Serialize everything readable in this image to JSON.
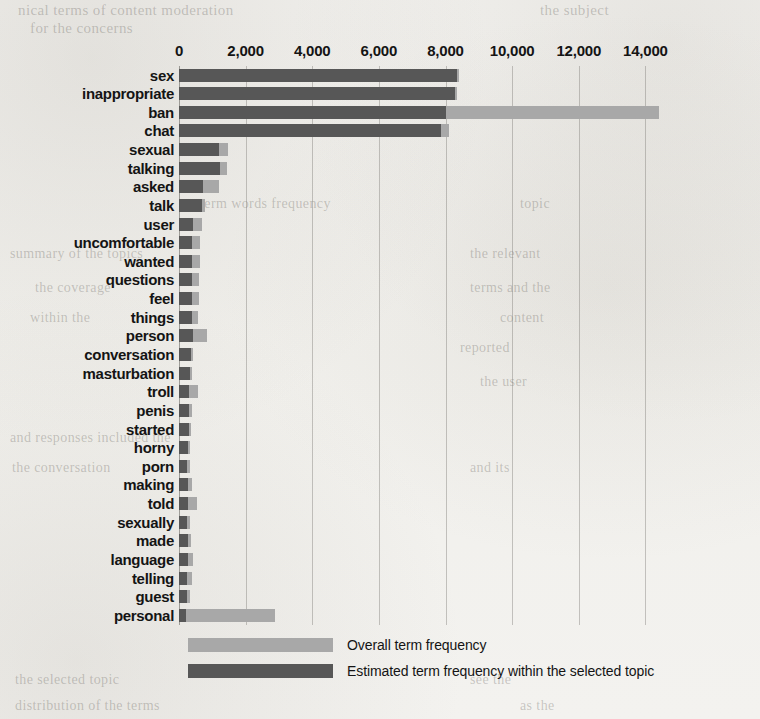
{
  "chart_data": {
    "type": "bar",
    "orientation": "horizontal",
    "title": "",
    "subtitle": "",
    "xlabel": "",
    "ylabel": "",
    "grid": true,
    "xlim": [
      0,
      16000
    ],
    "xticks": [
      0,
      2000,
      4000,
      6000,
      8000,
      10000,
      12000,
      14000
    ],
    "xtick_labels": [
      "0",
      "2,000",
      "4,000",
      "6,000",
      "8,000",
      "10,000",
      "12,000",
      "14,000"
    ],
    "legend_position": "bottom",
    "categories": [
      "sex",
      "inappropriate",
      "ban",
      "chat",
      "sexual",
      "talking",
      "asked",
      "talk",
      "user",
      "uncomfortable",
      "wanted",
      "questions",
      "feel",
      "things",
      "person",
      "conversation",
      "masturbation",
      "troll",
      "penis",
      "started",
      "horny",
      "porn",
      "making",
      "told",
      "sexually",
      "made",
      "language",
      "telling",
      "guest",
      "personal"
    ],
    "series": [
      {
        "name": "Overall term frequency",
        "color": "#a8a8a8",
        "values": [
          8400,
          8350,
          14400,
          8100,
          1470,
          1440,
          1200,
          780,
          700,
          640,
          620,
          600,
          590,
          580,
          840,
          420,
          400,
          560,
          380,
          370,
          340,
          330,
          400,
          530,
          330,
          350,
          430,
          400,
          330,
          2890
        ]
      },
      {
        "name": "Estimated term frequency within the selected topic",
        "color": "#575757",
        "values": [
          8360,
          8300,
          8000,
          7850,
          1200,
          1230,
          720,
          700,
          430,
          400,
          400,
          390,
          390,
          380,
          420,
          350,
          340,
          300,
          300,
          290,
          270,
          250,
          260,
          270,
          250,
          260,
          260,
          250,
          250,
          210
        ]
      }
    ]
  },
  "legend": {
    "items": [
      {
        "label": "Overall term frequency",
        "swatch": "overall"
      },
      {
        "label": "Estimated term frequency within the selected topic",
        "swatch": "selected"
      }
    ]
  },
  "page_bleed": [
    {
      "text": "nical terms of content moderation",
      "x": 18,
      "y": 2,
      "size": 15
    },
    {
      "text": "the subject",
      "x": 540,
      "y": 2,
      "size": 15
    },
    {
      "text": "for the concerns",
      "x": 30,
      "y": 20,
      "size": 15
    },
    {
      "text": "term words frequency",
      "x": 200,
      "y": 196,
      "size": 14
    },
    {
      "text": "topic",
      "x": 520,
      "y": 196,
      "size": 14
    },
    {
      "text": "summary of the topics",
      "x": 10,
      "y": 246,
      "size": 14
    },
    {
      "text": "the relevant",
      "x": 470,
      "y": 246,
      "size": 14
    },
    {
      "text": "the coverage",
      "x": 35,
      "y": 280,
      "size": 14
    },
    {
      "text": "terms and the",
      "x": 470,
      "y": 280,
      "size": 14
    },
    {
      "text": "within the",
      "x": 30,
      "y": 310,
      "size": 14
    },
    {
      "text": "content",
      "x": 500,
      "y": 310,
      "size": 14
    },
    {
      "text": "reported",
      "x": 460,
      "y": 340,
      "size": 14
    },
    {
      "text": "the user",
      "x": 480,
      "y": 374,
      "size": 14
    },
    {
      "text": "and responses included the",
      "x": 10,
      "y": 430,
      "size": 14
    },
    {
      "text": "the conversation",
      "x": 12,
      "y": 460,
      "size": 14
    },
    {
      "text": "and its",
      "x": 470,
      "y": 460,
      "size": 14
    },
    {
      "text": "the selected topic",
      "x": 15,
      "y": 672,
      "size": 14
    },
    {
      "text": "see the",
      "x": 470,
      "y": 672,
      "size": 14
    },
    {
      "text": "distribution of the terms",
      "x": 15,
      "y": 698,
      "size": 14
    },
    {
      "text": "as the",
      "x": 520,
      "y": 698,
      "size": 14
    }
  ]
}
